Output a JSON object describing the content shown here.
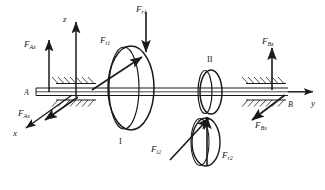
{
  "figure": {
    "kind": "shaft-gear-force-diagram",
    "background_color": "#ffffff",
    "line_color": "#1a1a1a"
  },
  "axes": {
    "z": {
      "label": "z",
      "direction": "up"
    },
    "y": {
      "label": "y",
      "direction": "right"
    },
    "x": {
      "label": "x",
      "direction": "down-left"
    }
  },
  "supports": [
    {
      "name": "A",
      "label": "A",
      "position": "left"
    },
    {
      "name": "B",
      "label": "B",
      "position": "right"
    }
  ],
  "gears": [
    {
      "name": "gear-1",
      "label": "I",
      "label_position": "below"
    },
    {
      "name": "gear-2",
      "label": "II",
      "label_position": "above"
    }
  ],
  "forces": [
    {
      "id": "f-az",
      "base": "F",
      "sub": "Az",
      "text": "FAz",
      "description": "bearing A reaction along z (up)"
    },
    {
      "id": "f-ax",
      "base": "F",
      "sub": "Ax",
      "text": "FAx",
      "description": "bearing A reaction along x (down-left)"
    },
    {
      "id": "f-r1",
      "base": "F",
      "sub": "r1",
      "text": "Fr1",
      "description": "radial force on gear I (down)"
    },
    {
      "id": "f-t1",
      "base": "F",
      "sub": "t1",
      "text": "Ft1",
      "description": "tangential force on gear I (up-right)"
    },
    {
      "id": "f-t2",
      "base": "F",
      "sub": "t2",
      "text": "Ft2",
      "description": "tangential force on gear II (up-right)"
    },
    {
      "id": "f-r2",
      "base": "F",
      "sub": "r2",
      "text": "Fr2",
      "description": "radial force on gear II (up)"
    },
    {
      "id": "f-bz",
      "base": "F",
      "sub": "Bz",
      "text": "FBz",
      "description": "bearing B reaction along z (up)"
    },
    {
      "id": "f-bx",
      "base": "F",
      "sub": "Bx",
      "text": "FBx",
      "description": "bearing B reaction along x (down-left)"
    }
  ]
}
